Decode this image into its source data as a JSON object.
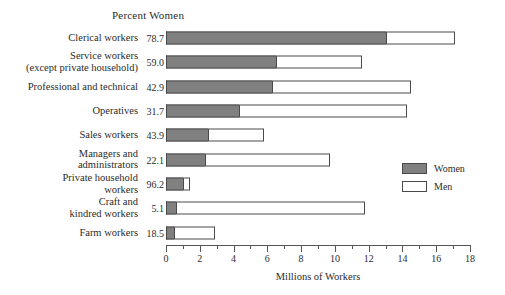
{
  "chart_data": {
    "type": "bar",
    "title": "",
    "orientation": "horizontal",
    "stacked": true,
    "xlabel": "Millions of Workers",
    "ylabel": "",
    "xlim": [
      0,
      18
    ],
    "xticks": [
      0,
      2,
      4,
      6,
      8,
      10,
      12,
      14,
      16,
      18
    ],
    "xtick_labels": [
      "0",
      "2",
      "4",
      "6",
      "8",
      "10",
      "12",
      "14",
      "16",
      "18"
    ],
    "minor_tick_step": 1,
    "grid": false,
    "legend_position": "right",
    "percent_column_header": "Percent Women",
    "categories": [
      "Clerical workers",
      "Service workers\n(except private household)",
      "Professional and technical",
      "Operatives",
      "Sales workers",
      "Managers and\nadministrators",
      "Private household\nworkers",
      "Craft and\nkindred workers",
      "Farm workers"
    ],
    "percent_women": [
      "78.7",
      "59.0",
      "42.9",
      "31.7",
      "43.9",
      "22.1",
      "96.2",
      "5.1",
      "18.5"
    ],
    "series": [
      {
        "name": "Women",
        "color": "#808080",
        "values": [
          13.0,
          6.5,
          6.3,
          4.3,
          2.5,
          2.3,
          1.0,
          0.6,
          0.5
        ]
      },
      {
        "name": "Men",
        "color": "#ffffff",
        "values": [
          4.1,
          5.1,
          8.2,
          10.0,
          3.3,
          7.4,
          0.4,
          11.2,
          2.4
        ]
      }
    ],
    "totals": [
      17.1,
      11.6,
      14.5,
      14.3,
      5.8,
      9.7,
      1.4,
      11.8,
      2.9
    ]
  },
  "legend": {
    "items": [
      {
        "label": "Women",
        "swatch": "filled-gray"
      },
      {
        "label": "Men",
        "swatch": "outlined-white"
      }
    ]
  },
  "colors": {
    "women_fill": "#808080",
    "men_fill": "#ffffff",
    "outline": "#4a4a4a",
    "text": "#2b2b2b",
    "axis": "#555555"
  }
}
